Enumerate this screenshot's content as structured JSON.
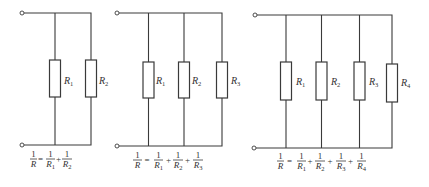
{
  "diagram": {
    "colors": {
      "stroke": "#3a3a3a",
      "text": "#333333",
      "background": "#ffffff"
    }
  },
  "circuits": [
    {
      "resistors": [
        {
          "symbol": "R",
          "subscript": "1"
        },
        {
          "symbol": "R",
          "subscript": "2"
        }
      ],
      "formula": {
        "lhs": {
          "num": "1",
          "den": "R"
        },
        "equals": "=",
        "plus": "+",
        "terms": [
          {
            "num": "1",
            "den": "R",
            "sub": "1"
          },
          {
            "num": "1",
            "den": "R",
            "sub": "2"
          }
        ]
      }
    },
    {
      "resistors": [
        {
          "symbol": "R",
          "subscript": "1"
        },
        {
          "symbol": "R",
          "subscript": "2"
        },
        {
          "symbol": "R",
          "subscript": "3"
        }
      ],
      "formula": {
        "lhs": {
          "num": "1",
          "den": "R"
        },
        "equals": "=",
        "plus": "+",
        "terms": [
          {
            "num": "1",
            "den": "R",
            "sub": "1"
          },
          {
            "num": "1",
            "den": "R",
            "sub": "2"
          },
          {
            "num": "1",
            "den": "R",
            "sub": "3"
          }
        ]
      }
    },
    {
      "resistors": [
        {
          "symbol": "R",
          "subscript": "1"
        },
        {
          "symbol": "R",
          "subscript": "2"
        },
        {
          "symbol": "R",
          "subscript": "3"
        },
        {
          "symbol": "R",
          "subscript": "4"
        }
      ],
      "formula": {
        "lhs": {
          "num": "1",
          "den": "R"
        },
        "equals": "=",
        "plus": "+",
        "terms": [
          {
            "num": "1",
            "den": "R",
            "sub": "1"
          },
          {
            "num": "1",
            "den": "R",
            "sub": "2"
          },
          {
            "num": "1",
            "den": "R",
            "sub": "3"
          },
          {
            "num": "1",
            "den": "R",
            "sub": "4"
          }
        ]
      }
    }
  ]
}
